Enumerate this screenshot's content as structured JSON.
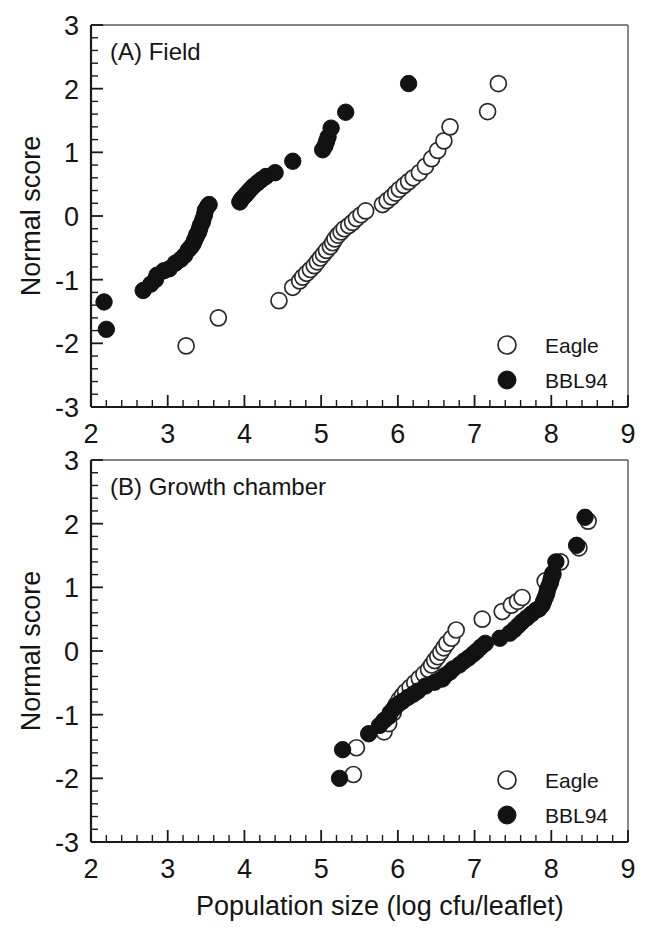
{
  "figure": {
    "width": 660,
    "height": 928,
    "background": "#ffffff",
    "ink_color": "#121212"
  },
  "axis_titles": {
    "x": "Population size (log cfu/leaflet)",
    "y": "Normal score"
  },
  "legend": {
    "entries": [
      {
        "label": "Eagle",
        "marker": "open-circle"
      },
      {
        "label": "BBL94",
        "marker": "filled-circle"
      }
    ]
  },
  "chart_data": [
    {
      "type": "scatter",
      "panel": "A",
      "title": "(A) Field",
      "xlabel": "Population size (log cfu/leaflet)",
      "ylabel": "Normal score",
      "xlim": [
        2,
        9
      ],
      "ylim": [
        -3,
        3
      ],
      "xticks": [
        2,
        3,
        4,
        5,
        6,
        7,
        8,
        9
      ],
      "yticks": [
        -3,
        -2,
        -1,
        0,
        1,
        2,
        3
      ],
      "xtick_labels": [
        "2",
        "3",
        "4",
        "5",
        "6",
        "7",
        "8",
        "9"
      ],
      "ytick_labels": [
        "-3",
        "-2",
        "-1",
        "0",
        "1",
        "2",
        "3"
      ],
      "minor_ticks_per_interval": 4,
      "grid": false,
      "legend_position": "bottom-right",
      "series": [
        {
          "name": "BBL94",
          "marker": "filled-circle",
          "color": "#121212",
          "points": [
            [
              2.17,
              -1.35
            ],
            [
              2.2,
              -1.78
            ],
            [
              2.68,
              -1.17
            ],
            [
              2.78,
              -1.07
            ],
            [
              2.84,
              -1.0
            ],
            [
              2.86,
              -0.93
            ],
            [
              2.95,
              -0.86
            ],
            [
              3.02,
              -0.83
            ],
            [
              3.1,
              -0.74
            ],
            [
              3.17,
              -0.68
            ],
            [
              3.22,
              -0.62
            ],
            [
              3.27,
              -0.53
            ],
            [
              3.3,
              -0.49
            ],
            [
              3.33,
              -0.44
            ],
            [
              3.35,
              -0.38
            ],
            [
              3.37,
              -0.33
            ],
            [
              3.38,
              -0.29
            ],
            [
              3.4,
              -0.26
            ],
            [
              3.41,
              -0.22
            ],
            [
              3.42,
              -0.18
            ],
            [
              3.43,
              -0.14
            ],
            [
              3.45,
              -0.1
            ],
            [
              3.46,
              -0.05
            ],
            [
              3.48,
              0.02
            ],
            [
              3.49,
              0.09
            ],
            [
              3.52,
              0.15
            ],
            [
              3.54,
              0.18
            ],
            [
              3.94,
              0.22
            ],
            [
              3.96,
              0.26
            ],
            [
              3.99,
              0.3
            ],
            [
              4.02,
              0.34
            ],
            [
              4.05,
              0.38
            ],
            [
              4.08,
              0.42
            ],
            [
              4.12,
              0.47
            ],
            [
              4.17,
              0.52
            ],
            [
              4.22,
              0.57
            ],
            [
              4.28,
              0.62
            ],
            [
              4.4,
              0.68
            ],
            [
              4.63,
              0.86
            ],
            [
              5.02,
              1.04
            ],
            [
              5.05,
              1.1
            ],
            [
              5.07,
              1.17
            ],
            [
              5.09,
              1.24
            ],
            [
              5.13,
              1.38
            ],
            [
              5.32,
              1.63
            ],
            [
              6.14,
              2.08
            ]
          ]
        },
        {
          "name": "Eagle",
          "marker": "open-circle",
          "color": "#ffffff",
          "points": [
            [
              3.24,
              -2.04
            ],
            [
              3.66,
              -1.6
            ],
            [
              4.45,
              -1.33
            ],
            [
              4.63,
              -1.12
            ],
            [
              4.72,
              -1.02
            ],
            [
              4.76,
              -0.96
            ],
            [
              4.81,
              -0.9
            ],
            [
              4.86,
              -0.84
            ],
            [
              4.91,
              -0.78
            ],
            [
              4.95,
              -0.72
            ],
            [
              4.99,
              -0.66
            ],
            [
              5.03,
              -0.6
            ],
            [
              5.07,
              -0.54
            ],
            [
              5.12,
              -0.48
            ],
            [
              5.15,
              -0.42
            ],
            [
              5.18,
              -0.36
            ],
            [
              5.22,
              -0.3
            ],
            [
              5.26,
              -0.25
            ],
            [
              5.3,
              -0.2
            ],
            [
              5.36,
              -0.15
            ],
            [
              5.41,
              -0.1
            ],
            [
              5.46,
              -0.04
            ],
            [
              5.52,
              0.02
            ],
            [
              5.58,
              0.08
            ],
            [
              5.8,
              0.18
            ],
            [
              5.86,
              0.24
            ],
            [
              5.92,
              0.3
            ],
            [
              5.97,
              0.36
            ],
            [
              6.02,
              0.42
            ],
            [
              6.08,
              0.48
            ],
            [
              6.14,
              0.54
            ],
            [
              6.2,
              0.6
            ],
            [
              6.28,
              0.68
            ],
            [
              6.36,
              0.78
            ],
            [
              6.44,
              0.9
            ],
            [
              6.52,
              1.03
            ],
            [
              6.6,
              1.18
            ],
            [
              6.68,
              1.4
            ],
            [
              7.17,
              1.64
            ],
            [
              7.31,
              2.08
            ]
          ]
        }
      ]
    },
    {
      "type": "scatter",
      "panel": "B",
      "title": "(B) Growth chamber",
      "xlabel": "Population size (log cfu/leaflet)",
      "ylabel": "Normal score",
      "xlim": [
        2,
        9
      ],
      "ylim": [
        -3,
        3
      ],
      "xticks": [
        2,
        3,
        4,
        5,
        6,
        7,
        8,
        9
      ],
      "yticks": [
        -3,
        -2,
        -1,
        0,
        1,
        2,
        3
      ],
      "xtick_labels": [
        "2",
        "3",
        "4",
        "5",
        "6",
        "7",
        "8",
        "9"
      ],
      "ytick_labels": [
        "-3",
        "-2",
        "-1",
        "0",
        "1",
        "2",
        "3"
      ],
      "minor_ticks_per_interval": 4,
      "grid": false,
      "legend_position": "bottom-right",
      "series": [
        {
          "name": "BBL94",
          "marker": "filled-circle",
          "color": "#121212",
          "points": [
            [
              5.24,
              -2.0
            ],
            [
              5.28,
              -1.55
            ],
            [
              5.62,
              -1.3
            ],
            [
              5.76,
              -1.17
            ],
            [
              5.82,
              -1.09
            ],
            [
              5.88,
              -1.03
            ],
            [
              5.9,
              -0.97
            ],
            [
              5.95,
              -0.9
            ],
            [
              6.0,
              -0.84
            ],
            [
              6.06,
              -0.79
            ],
            [
              6.13,
              -0.73
            ],
            [
              6.2,
              -0.68
            ],
            [
              6.26,
              -0.63
            ],
            [
              6.36,
              -0.55
            ],
            [
              6.48,
              -0.49
            ],
            [
              6.58,
              -0.44
            ],
            [
              6.62,
              -0.38
            ],
            [
              6.68,
              -0.33
            ],
            [
              6.72,
              -0.28
            ],
            [
              6.8,
              -0.22
            ],
            [
              6.86,
              -0.16
            ],
            [
              6.92,
              -0.11
            ],
            [
              6.98,
              -0.05
            ],
            [
              7.03,
              0.0
            ],
            [
              7.08,
              0.06
            ],
            [
              7.14,
              0.12
            ],
            [
              7.33,
              0.2
            ],
            [
              7.46,
              0.28
            ],
            [
              7.52,
              0.34
            ],
            [
              7.57,
              0.4
            ],
            [
              7.62,
              0.46
            ],
            [
              7.68,
              0.52
            ],
            [
              7.74,
              0.58
            ],
            [
              7.8,
              0.64
            ],
            [
              7.84,
              0.66
            ],
            [
              7.88,
              0.72
            ],
            [
              7.9,
              0.78
            ],
            [
              7.92,
              0.84
            ],
            [
              7.94,
              0.9
            ],
            [
              7.95,
              0.96
            ],
            [
              7.97,
              1.02
            ],
            [
              7.99,
              1.08
            ],
            [
              8.0,
              1.14
            ],
            [
              8.02,
              1.22
            ],
            [
              8.06,
              1.4
            ],
            [
              8.33,
              1.66
            ],
            [
              8.44,
              2.1
            ]
          ]
        },
        {
          "name": "Eagle",
          "marker": "open-circle",
          "color": "#ffffff",
          "points": [
            [
              5.42,
              -1.94
            ],
            [
              5.46,
              -1.52
            ],
            [
              5.82,
              -1.27
            ],
            [
              5.88,
              -1.14
            ],
            [
              5.94,
              -0.97
            ],
            [
              5.98,
              -0.84
            ],
            [
              6.02,
              -0.76
            ],
            [
              6.06,
              -0.7
            ],
            [
              6.1,
              -0.64
            ],
            [
              6.16,
              -0.57
            ],
            [
              6.22,
              -0.5
            ],
            [
              6.28,
              -0.43
            ],
            [
              6.34,
              -0.36
            ],
            [
              6.4,
              -0.29
            ],
            [
              6.44,
              -0.22
            ],
            [
              6.48,
              -0.15
            ],
            [
              6.52,
              -0.09
            ],
            [
              6.56,
              -0.02
            ],
            [
              6.6,
              0.05
            ],
            [
              6.64,
              0.12
            ],
            [
              6.7,
              0.2
            ],
            [
              6.76,
              0.33
            ],
            [
              7.1,
              0.5
            ],
            [
              7.36,
              0.62
            ],
            [
              7.48,
              0.72
            ],
            [
              7.56,
              0.78
            ],
            [
              7.62,
              0.84
            ],
            [
              7.92,
              1.1
            ],
            [
              8.02,
              1.2
            ],
            [
              8.12,
              1.4
            ],
            [
              8.36,
              1.62
            ],
            [
              8.48,
              2.04
            ]
          ]
        }
      ]
    }
  ]
}
